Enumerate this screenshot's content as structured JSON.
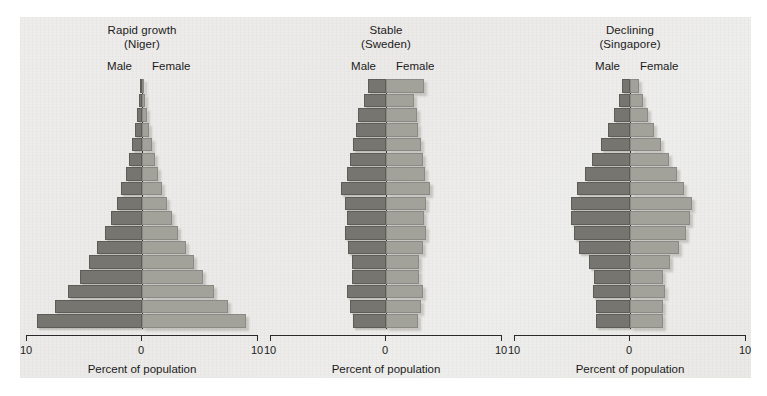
{
  "figure": {
    "background_color": "#ffffff",
    "panel_color": "#ecebe8"
  },
  "axis": {
    "left_tick_label": "10",
    "center_tick_label": "0",
    "right_tick_label": "10",
    "axis_title": "Percent of population",
    "male_label": "Male",
    "female_label": "Female"
  },
  "colors": {
    "male_bar": "#77756f",
    "female_bar": "#a3a29a",
    "axis_line": "#262626",
    "text": "#1b1b1b"
  },
  "chart_data": {
    "type": "bar",
    "xlabel": "Percent of population",
    "ylabel": "",
    "xlim": [
      -10,
      10
    ],
    "grid": false,
    "legend": [
      "Male",
      "Female"
    ],
    "legend_position": "top-inside",
    "panels": [
      {
        "title_line1": "Rapid growth",
        "title_line2": "(Niger)",
        "country": "Niger",
        "age_groups": [
          "0-4",
          "5-9",
          "10-14",
          "15-19",
          "20-24",
          "25-29",
          "30-34",
          "35-39",
          "40-44",
          "45-49",
          "50-54",
          "55-59",
          "60-64",
          "65-69",
          "70-74",
          "75-79",
          "80+"
        ],
        "series": [
          {
            "name": "Male",
            "values": [
              9.1,
              7.6,
              6.4,
              5.4,
              4.6,
              3.9,
              3.2,
              2.7,
              2.2,
              1.8,
              1.4,
              1.1,
              0.85,
              0.6,
              0.4,
              0.25,
              0.12
            ]
          },
          {
            "name": "Female",
            "values": [
              9.0,
              7.5,
              6.3,
              5.3,
              4.5,
              3.8,
              3.1,
              2.6,
              2.15,
              1.75,
              1.4,
              1.1,
              0.85,
              0.6,
              0.4,
              0.25,
              0.12
            ]
          }
        ]
      },
      {
        "title_line1": "Stable",
        "title_line2": "(Sweden)",
        "country": "Sweden",
        "age_groups": [
          "0-4",
          "5-9",
          "10-14",
          "15-19",
          "20-24",
          "25-29",
          "30-34",
          "35-39",
          "40-44",
          "45-49",
          "50-54",
          "55-59",
          "60-64",
          "65-69",
          "70-74",
          "75-79",
          "80+"
        ],
        "series": [
          {
            "name": "Male",
            "values": [
              2.9,
              3.1,
              3.4,
              3.0,
              3.0,
              3.3,
              3.6,
              3.4,
              3.6,
              3.9,
              3.4,
              3.1,
              2.9,
              2.6,
              2.4,
              1.9,
              1.6
            ]
          },
          {
            "name": "Female",
            "values": [
              2.8,
              3.0,
              3.2,
              2.9,
              2.9,
              3.2,
              3.5,
              3.3,
              3.5,
              3.8,
              3.4,
              3.2,
              3.0,
              2.8,
              2.7,
              2.4,
              3.3
            ]
          }
        ]
      },
      {
        "title_line1": "Declining",
        "title_line2": "(Singapore)",
        "country": "Singapore",
        "age_groups": [
          "0-4",
          "5-9",
          "10-14",
          "15-19",
          "20-24",
          "25-29",
          "30-34",
          "35-39",
          "40-44",
          "45-49",
          "50-54",
          "55-59",
          "60-64",
          "65-69",
          "70-74",
          "75-79",
          "80+"
        ],
        "series": [
          {
            "name": "Male",
            "values": [
              3.0,
              3.0,
              3.2,
              3.1,
              3.6,
              4.4,
              4.9,
              5.1,
              5.1,
              4.6,
              3.9,
              3.3,
              2.5,
              1.9,
              1.4,
              1.0,
              0.7
            ]
          },
          {
            "name": "Female",
            "values": [
              2.9,
              2.9,
              3.0,
              2.9,
              3.5,
              4.3,
              4.9,
              5.2,
              5.4,
              4.7,
              4.1,
              3.4,
              2.7,
              2.1,
              1.6,
              1.1,
              0.8
            ]
          }
        ]
      }
    ]
  }
}
